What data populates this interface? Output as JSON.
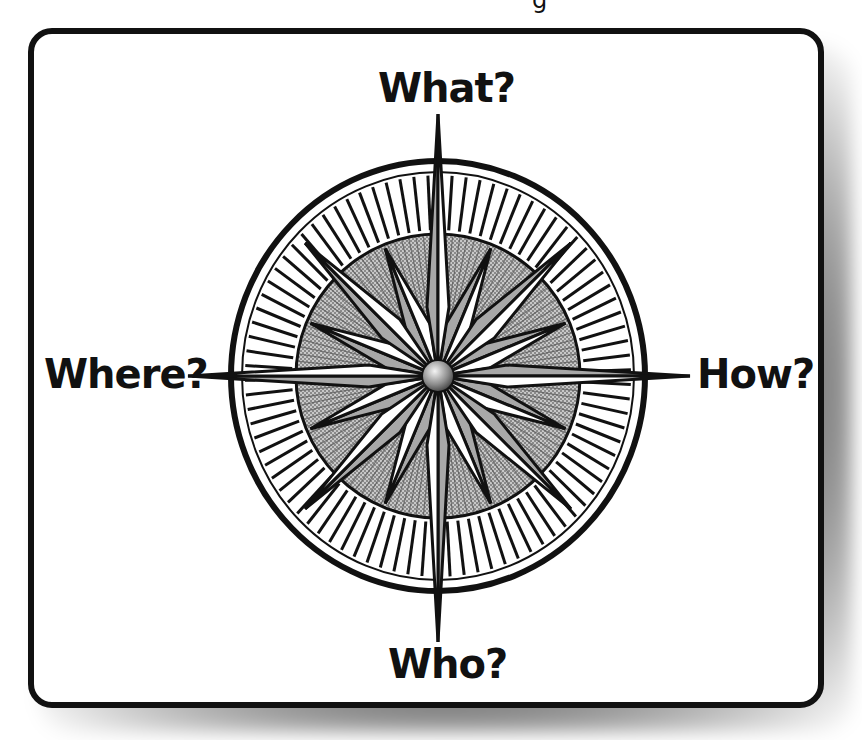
{
  "header": {
    "cropped_text": "g"
  },
  "diagram": {
    "type": "compass-rose",
    "labels": {
      "north": "What?",
      "east": "How?",
      "south": "Who?",
      "west": "Where?"
    },
    "colors": {
      "outline": "#111111",
      "point_light": "#ffffff",
      "point_dark": "#a8a8a8",
      "hatch": "#111111",
      "inner_disc": "#b0b0b0",
      "hub": "#9a9a9a",
      "card_background": "#ffffff"
    }
  }
}
